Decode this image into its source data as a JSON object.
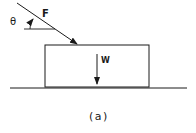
{
  "diagram": {
    "caption": "(a)",
    "labels": {
      "force": "F",
      "angle": "θ",
      "weight": "W"
    },
    "elements": {
      "block": "rectangular block resting on horizontal surface",
      "force_arrow": "applied force F pushing down at angle θ below horizontal",
      "weight_arrow": "weight W acting downward",
      "ground": "horizontal surface line"
    },
    "colors": {
      "stroke": "#1a1a1a",
      "background": "#ffffff"
    }
  }
}
